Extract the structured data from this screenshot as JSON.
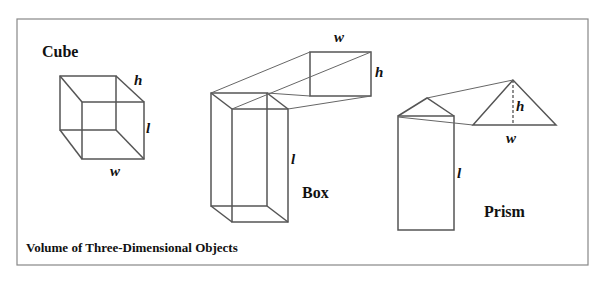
{
  "diagram": {
    "caption": "Volume of Three-Dimensional Objects",
    "shapes": [
      {
        "name": "Cube",
        "labels": {
          "h": "h",
          "l": "l",
          "w": "w"
        }
      },
      {
        "name": "Box",
        "labels": {
          "w": "w",
          "h": "h",
          "l": "l"
        }
      },
      {
        "name": "Prism",
        "labels": {
          "h": "h",
          "w": "w",
          "l": "l"
        }
      }
    ]
  }
}
